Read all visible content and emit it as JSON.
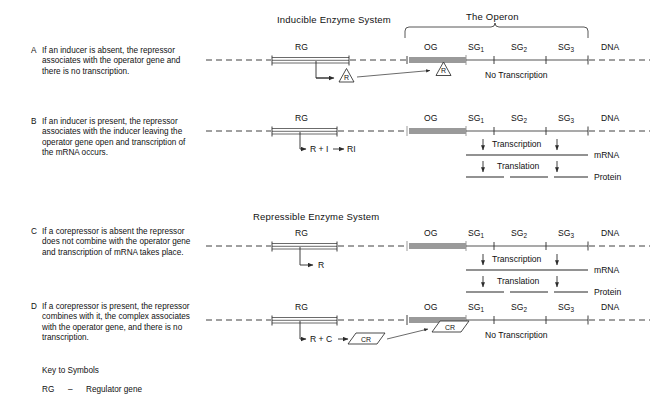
{
  "figure": {
    "headings": {
      "inducible": "Inducible Enzyme System",
      "repressible": "Repressible Enzyme System",
      "operon": "The Operon"
    },
    "gene_labels": {
      "rg": "RG",
      "og": "OG",
      "sg1": "SG",
      "sg1_sub": "1",
      "sg2": "SG",
      "sg2_sub": "2",
      "sg3": "SG",
      "sg3_sub": "3",
      "dna": "DNA"
    },
    "flow_labels": {
      "transcription": "Transcription",
      "translation": "Translation",
      "no_transcription": "No Transcription",
      "mrna": "mRNA",
      "protein": "Protein"
    },
    "symbols": {
      "repressor": "R",
      "corepressor_complex": "CR"
    },
    "rows": [
      {
        "letter": "A",
        "description": "If an inducer is absent, the repressor associates with the operator gene and there is no transcription.",
        "reaction": "",
        "status": "No Transcription"
      },
      {
        "letter": "B",
        "description": "If an inducer is present, the repressor associates with the inducer leaving the operator gene open and transcription of the mRNA occurs.",
        "reaction": "R + I",
        "reaction_product": "RI",
        "status": ""
      },
      {
        "letter": "C",
        "description": "If a corepressor is absent the repressor does not combine with the operator gene and transcription of mRNA takes place.",
        "reaction": "R",
        "status": ""
      },
      {
        "letter": "D",
        "description": "If a corepressor is present, the repressor combines with it, the complex associates with the operator gene, and there is no transcription.",
        "reaction": "R + C",
        "reaction_product": "CR",
        "status": "No Transcription"
      }
    ],
    "key": {
      "title": "Key to Symbols",
      "entries": [
        {
          "symbol": "RG",
          "dash": "–",
          "meaning": "Regulator gene"
        }
      ]
    },
    "colors": {
      "line": "#2b2b2b",
      "operator_block": "#9a9a9a",
      "transcript": "#6e6e6e",
      "background": "#ffffff"
    }
  }
}
